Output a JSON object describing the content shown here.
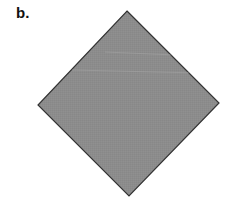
{
  "panel": {
    "label": "b."
  },
  "shape": {
    "type": "square-rotated-45 (diamond)",
    "vertices": {
      "top": [
        127,
        11
      ],
      "right": [
        219,
        103
      ],
      "bottom": [
        129,
        196
      ],
      "left": [
        38,
        105
      ]
    },
    "fill_color": "#8c8c8c",
    "stroke_color": "#333333",
    "streak_color": "#a4a4a4"
  }
}
